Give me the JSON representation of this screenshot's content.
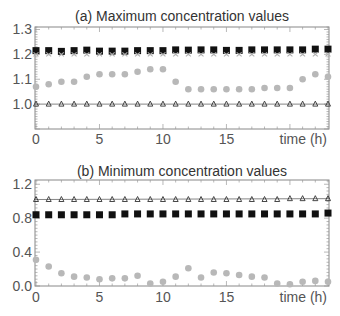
{
  "chart_data": [
    {
      "type": "scatter",
      "title": "(a) Maximum concentration values",
      "xlabel": "time (h)",
      "ylabel": "",
      "xlim": [
        0,
        23
      ],
      "ylim": [
        0.9,
        1.31
      ],
      "x_ticks": [
        0,
        5,
        10,
        15
      ],
      "x_tick_labels": [
        "0",
        "5",
        "10",
        "15"
      ],
      "y_ticks": [
        1.0,
        1.1,
        1.2,
        1.3
      ],
      "y_tick_labels": [
        "1.0",
        "1.1",
        "1.2",
        "1.3"
      ],
      "grid": false,
      "legend": null,
      "x": [
        0,
        1,
        2,
        3,
        4,
        5,
        6,
        7,
        8,
        9,
        10,
        11,
        12,
        13,
        14,
        15,
        16,
        17,
        18,
        19,
        20,
        21,
        22,
        23
      ],
      "series": [
        {
          "name": "black squares",
          "marker": "square",
          "color": "#111111",
          "values": [
            1.215,
            1.215,
            1.212,
            1.215,
            1.217,
            1.213,
            1.213,
            1.213,
            1.215,
            1.215,
            1.215,
            1.218,
            1.217,
            1.218,
            1.218,
            1.216,
            1.216,
            1.218,
            1.218,
            1.218,
            1.218,
            1.218,
            1.221,
            1.221
          ]
        },
        {
          "name": "gray crosses",
          "marker": "cross",
          "color": "#b0b0b0",
          "values": [
            1.2,
            1.2,
            1.2,
            1.2,
            1.2,
            1.2,
            1.2,
            1.2,
            1.2,
            1.2,
            1.2,
            1.2,
            1.2,
            1.2,
            1.2,
            1.2,
            1.2,
            1.2,
            1.2,
            1.2,
            1.2,
            1.2,
            1.2,
            1.2
          ]
        },
        {
          "name": "gray circles",
          "marker": "circle",
          "color": "#b8b8b8",
          "values": [
            1.07,
            1.08,
            1.09,
            1.09,
            1.11,
            1.12,
            1.12,
            1.12,
            1.13,
            1.14,
            1.14,
            1.09,
            1.06,
            1.06,
            1.06,
            1.06,
            1.06,
            1.06,
            1.065,
            1.065,
            1.065,
            1.1,
            1.12,
            1.11
          ]
        },
        {
          "name": "dark triangles (reference line)",
          "marker": "triangle",
          "color": "#333333",
          "line": true,
          "values": [
            1.0,
            1.0,
            1.0,
            1.0,
            1.0,
            1.0,
            1.0,
            1.0,
            1.0,
            1.0,
            1.0,
            1.0,
            1.0,
            1.0,
            1.0,
            1.0,
            1.0,
            1.0,
            1.0,
            1.0,
            1.0,
            1.0,
            1.0,
            1.0
          ]
        }
      ]
    },
    {
      "type": "scatter",
      "title": "(b) Minimum concentration values",
      "xlabel": "time (h)",
      "ylabel": "",
      "xlim": [
        0,
        23
      ],
      "ylim": [
        0.0,
        1.25
      ],
      "x_ticks": [
        0,
        5,
        10,
        15
      ],
      "x_tick_labels": [
        "0",
        "5",
        "10",
        "15"
      ],
      "y_ticks": [
        0.0,
        0.4,
        0.8,
        1.2
      ],
      "y_tick_labels": [
        "0.0",
        "0.4",
        "0.8",
        "1.2"
      ],
      "grid": false,
      "legend": null,
      "x": [
        0,
        1,
        2,
        3,
        4,
        5,
        6,
        7,
        8,
        9,
        10,
        11,
        12,
        13,
        14,
        15,
        16,
        17,
        18,
        19,
        20,
        21,
        22,
        23
      ],
      "series": [
        {
          "name": "dark triangles (reference line)",
          "marker": "triangle",
          "color": "#333333",
          "line": true,
          "values": [
            1.02,
            1.02,
            1.02,
            1.02,
            1.02,
            1.02,
            1.02,
            1.02,
            1.02,
            1.02,
            1.02,
            1.02,
            1.02,
            1.02,
            1.02,
            1.02,
            1.02,
            1.02,
            1.02,
            1.02,
            1.03,
            1.03,
            1.03,
            1.03
          ]
        },
        {
          "name": "black squares",
          "marker": "square",
          "color": "#111111",
          "values": [
            0.84,
            0.84,
            0.84,
            0.84,
            0.84,
            0.84,
            0.84,
            0.85,
            0.85,
            0.85,
            0.85,
            0.85,
            0.85,
            0.85,
            0.85,
            0.85,
            0.85,
            0.85,
            0.85,
            0.85,
            0.85,
            0.85,
            0.85,
            0.86
          ]
        },
        {
          "name": "gray circles",
          "marker": "circle",
          "color": "#b8b8b8",
          "values": [
            0.31,
            0.23,
            0.15,
            0.11,
            0.1,
            0.08,
            0.09,
            0.09,
            0.12,
            0.03,
            0.05,
            0.11,
            0.21,
            0.1,
            0.16,
            0.15,
            0.13,
            0.11,
            0.1,
            0.03,
            0.02,
            0.05,
            0.06,
            0.05
          ]
        }
      ]
    }
  ]
}
